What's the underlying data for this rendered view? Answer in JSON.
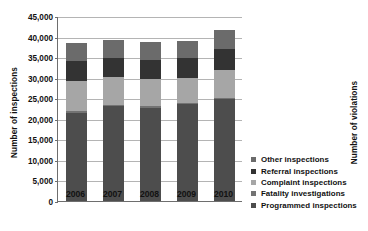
{
  "chart_data": {
    "type": "bar",
    "stacked": true,
    "title": "",
    "subtitle": "",
    "xlabel": "",
    "ylabel": "Number of inspections",
    "ylabel_right": "Number of violations",
    "categories": [
      "2006",
      "2007",
      "2008",
      "2009",
      "2010"
    ],
    "ylim": [
      0,
      45000
    ],
    "ytick_labels": [
      "0",
      "5,000",
      "10,000",
      "15,000",
      "20,000",
      "25,000",
      "30,000",
      "35,000",
      "40,000",
      "45,000"
    ],
    "ytick_values": [
      0,
      5000,
      10000,
      15000,
      20000,
      25000,
      30000,
      35000,
      40000,
      45000
    ],
    "grid": true,
    "legend_position": "bottom-right",
    "stack_order_bottom_to_top": [
      "Programmed inspections",
      "Fatality investigations",
      "Complaint inspections",
      "Referral inspections",
      "Other inspections"
    ],
    "series": [
      {
        "name": "Programmed inspections",
        "color": "#4d4d4d",
        "values": [
          21500,
          23000,
          22600,
          23500,
          24700
        ]
      },
      {
        "name": "Fatality investigations",
        "color": "#737373",
        "values": [
          400,
          400,
          400,
          400,
          400
        ]
      },
      {
        "name": "Complaint inspections",
        "color": "#a6a6a6",
        "values": [
          7300,
          6700,
          6700,
          6100,
          6700
        ]
      },
      {
        "name": "Referral inspections",
        "color": "#333333",
        "values": [
          4800,
          4700,
          4700,
          4800,
          5200
        ]
      },
      {
        "name": "Other inspections",
        "color": "#6b6b6b",
        "values": [
          4400,
          4300,
          4200,
          4200,
          4600
        ]
      }
    ],
    "totals": [
      38400,
      39100,
      38600,
      39000,
      41600
    ]
  },
  "legend": {
    "items": [
      {
        "label": "Other inspections",
        "color": "#6b6b6b"
      },
      {
        "label": "Referral inspections",
        "color": "#333333"
      },
      {
        "label": "Complaint inspections",
        "color": "#a6a6a6"
      },
      {
        "label": "Fatality investigations",
        "color": "#737373"
      },
      {
        "label": "Programmed inspections",
        "color": "#4d4d4d"
      }
    ]
  },
  "colors": {
    "background": "#ffffff",
    "axis": "#6e6e6e",
    "gridline": "#b4b4b4",
    "text": "#111111"
  }
}
